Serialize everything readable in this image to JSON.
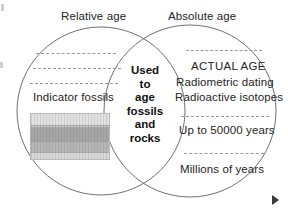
{
  "diagram": {
    "type": "venn",
    "sets": 2,
    "title_left": "Relative age",
    "title_right": "Absolute age",
    "left_set": {
      "name": "Relative age",
      "items": [
        {
          "label": "Indicator fossils",
          "kind": "text"
        },
        {
          "label": "rock-strata-block",
          "kind": "image"
        }
      ],
      "dashed_separators": 3
    },
    "right_set": {
      "name": "Absolute age",
      "items": [
        {
          "label": "ACTUAL AGE",
          "kind": "text"
        },
        {
          "label": "Radiometric dating",
          "kind": "text"
        },
        {
          "label": "Radioactive isotopes",
          "kind": "text"
        },
        {
          "label": "Up to 50000 years",
          "kind": "text"
        },
        {
          "label": "Millions of years",
          "kind": "text"
        }
      ],
      "dashed_separators": 3
    },
    "intersection": {
      "words": [
        "Used",
        "to",
        "age",
        "fossils",
        "and",
        "rocks"
      ],
      "text": "Used to age fossils and rocks"
    },
    "colors": {
      "outline": "#6f6f6f",
      "text": "#252525",
      "dash": "#9a9a9a",
      "strata_light": "#e2e2e2",
      "strata_mid": "#b6b6b6",
      "strata_dark": "#a6a6a6",
      "marker": "#3a3a3a",
      "background": "#ffffff"
    }
  },
  "marker": {
    "name": "play-marker",
    "glyph": "▶"
  }
}
